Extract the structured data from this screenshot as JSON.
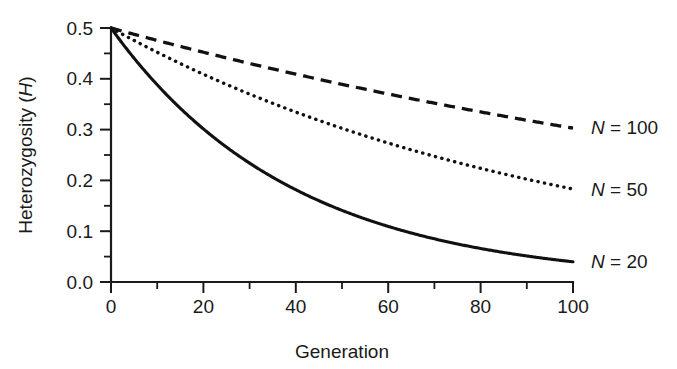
{
  "chart_data": {
    "type": "line",
    "title": "",
    "subtitle": "",
    "xlabel": "Generation",
    "ylabel": "Heterozygosity (H)",
    "ylabel_plain": "Heterozygosity (",
    "ylabel_italic": "H",
    "ylabel_tail": ")",
    "xlim": [
      0,
      100
    ],
    "ylim": [
      0.0,
      0.5
    ],
    "grid": false,
    "legend_position": "inline-right-end-of-line",
    "x_ticks": [
      0,
      20,
      40,
      60,
      80,
      100
    ],
    "x_tick_labels": [
      "0",
      "20",
      "40",
      "60",
      "80",
      "100"
    ],
    "x_minor_ticks": [
      10,
      30,
      50,
      70,
      90
    ],
    "y_ticks": [
      0.0,
      0.1,
      0.2,
      0.3,
      0.4,
      0.5
    ],
    "y_tick_labels": [
      "0.0",
      "0.1",
      "0.2",
      "0.3",
      "0.4",
      "0.5"
    ],
    "y_minor_ticks": [
      0.05,
      0.15,
      0.25,
      0.35,
      0.45
    ],
    "formula": "H(t) = 0.5 * (1 - 1/(2N))^t",
    "x": [
      0,
      5,
      10,
      15,
      20,
      25,
      30,
      35,
      40,
      45,
      50,
      55,
      60,
      65,
      70,
      75,
      80,
      85,
      90,
      95,
      100
    ],
    "series": [
      {
        "name": "N = 20",
        "name_symbol": "N",
        "name_rest": " = 20",
        "N": 20,
        "style": "solid",
        "color": "#111111",
        "label_x": 100,
        "label_y": 0.0395,
        "values": [
          0.5,
          0.4407,
          0.3885,
          0.3424,
          0.3018,
          0.266,
          0.2344,
          0.2066,
          0.1821,
          0.1605,
          0.1415,
          0.1247,
          0.1099,
          0.0969,
          0.0854,
          0.0753,
          0.0663,
          0.0585,
          0.0515,
          0.0454,
          0.04
        ]
      },
      {
        "name": "N = 50",
        "name_symbol": "N",
        "name_rest": " = 50",
        "N": 50,
        "style": "dotted",
        "color": "#111111",
        "label_x": 100,
        "label_y": 0.1821,
        "values": [
          0.5,
          0.4755,
          0.4521,
          0.43,
          0.4089,
          0.3888,
          0.3697,
          0.3516,
          0.3343,
          0.3179,
          0.3023,
          0.2875,
          0.2734,
          0.26,
          0.2472,
          0.2351,
          0.2235,
          0.2126,
          0.2021,
          0.1922,
          0.1828
        ]
      },
      {
        "name": "N = 100",
        "name_symbol": "N",
        "name_rest": " = 100",
        "N": 100,
        "style": "dashed",
        "color": "#111111",
        "label_x": 100,
        "label_y": 0.3032,
        "values": [
          0.5,
          0.4875,
          0.4756,
          0.4637,
          0.4522,
          0.441,
          0.4301,
          0.4194,
          0.409,
          0.3989,
          0.389,
          0.3793,
          0.3699,
          0.3607,
          0.3518,
          0.343,
          0.3345,
          0.3262,
          0.3181,
          0.3102,
          0.3025
        ]
      }
    ]
  },
  "figure": {
    "background_color": "#ffffff",
    "axis_color": "#1a1a1a"
  }
}
